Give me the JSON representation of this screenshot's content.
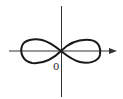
{
  "diagram": {
    "type": "lemniscate",
    "origin_label": "0",
    "colors": {
      "curve": "#1a1a1a",
      "axes": "#333333",
      "background": "#ffffff"
    },
    "x_axis": {
      "arrow": "right"
    },
    "y_axis": {
      "arrow": "none"
    }
  }
}
